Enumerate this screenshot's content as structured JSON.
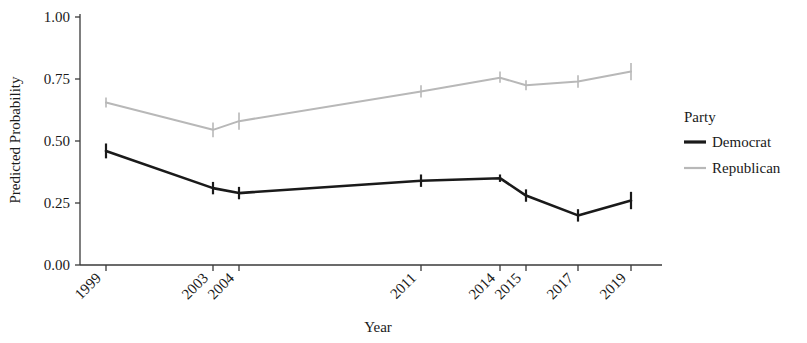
{
  "chart_data": {
    "type": "line",
    "title": "",
    "xlabel": "Year",
    "ylabel": "Predicted Probability",
    "categories": [
      "1999",
      "2003",
      "2004",
      "2011",
      "2014",
      "2015",
      "2017",
      "2019"
    ],
    "ylim": [
      0.0,
      1.0
    ],
    "yticks": [
      "0.00",
      "0.25",
      "0.50",
      "0.75",
      "1.00"
    ],
    "ytick_values": [
      0.0,
      0.25,
      0.5,
      0.75,
      1.0
    ],
    "grid": false,
    "legend_position": "right",
    "legend_title": "Party",
    "errorbars": true,
    "series": [
      {
        "name": "Democrat",
        "color": "#1a1a1a",
        "values": [
          0.46,
          0.31,
          0.29,
          0.34,
          0.35,
          0.28,
          0.2,
          0.26
        ],
        "err_low": [
          0.43,
          0.285,
          0.265,
          0.315,
          0.335,
          0.255,
          0.175,
          0.225
        ],
        "err_high": [
          0.49,
          0.335,
          0.315,
          0.365,
          0.365,
          0.305,
          0.225,
          0.295
        ]
      },
      {
        "name": "Republican",
        "color": "#b8b8b8",
        "values": [
          0.655,
          0.545,
          0.58,
          0.7,
          0.755,
          0.725,
          0.74,
          0.78
        ],
        "err_low": [
          0.635,
          0.515,
          0.545,
          0.675,
          0.735,
          0.705,
          0.715,
          0.745
        ],
        "err_high": [
          0.675,
          0.575,
          0.615,
          0.725,
          0.78,
          0.745,
          0.765,
          0.815
        ]
      }
    ]
  },
  "axis": {
    "x_title": "Year",
    "y_title": "Predicted Probability"
  },
  "legend": {
    "title": "Party",
    "items": [
      {
        "label": "Democrat",
        "color": "#1a1a1a"
      },
      {
        "label": "Republican",
        "color": "#b8b8b8"
      }
    ]
  }
}
